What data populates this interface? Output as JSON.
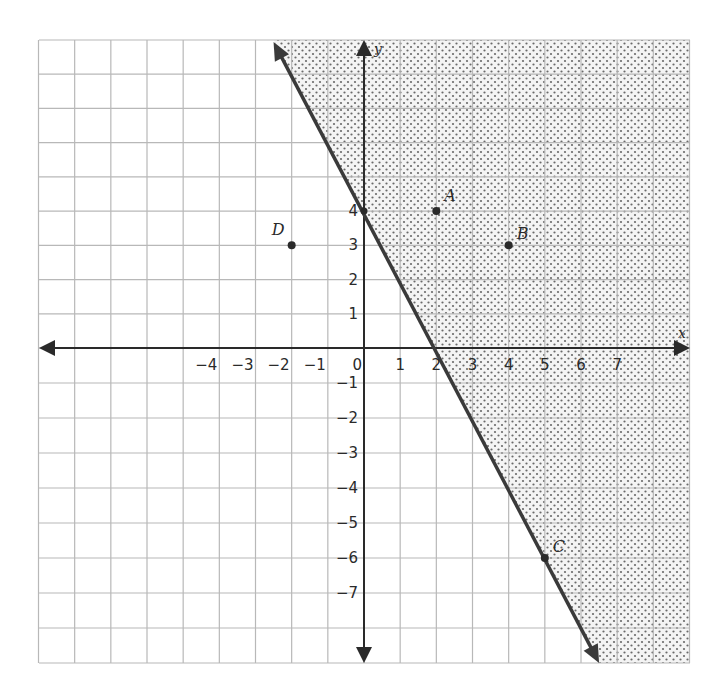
{
  "chart_data": {
    "type": "scatter",
    "title": "",
    "xlabel": "x",
    "ylabel": "y",
    "xlim": [
      -9,
      9
    ],
    "ylim": [
      -9,
      9
    ],
    "grid": true,
    "x_tick_labels": [
      "-4",
      "-3",
      "-2",
      "-1",
      "0",
      "1",
      "2",
      "3",
      "4",
      "5",
      "6",
      "7"
    ],
    "y_tick_labels": [
      "4",
      "3",
      "2",
      "1",
      "-1",
      "-2",
      "-3",
      "-4",
      "-5",
      "-6",
      "-7"
    ],
    "boundary_line": {
      "equation": "y = -2x + 4",
      "slope": -2,
      "intercept": 4,
      "style": "solid",
      "shaded_side": "right",
      "passes_through": [
        [
          0,
          4
        ],
        [
          2,
          0
        ],
        [
          5,
          -6
        ]
      ]
    },
    "points": [
      {
        "label": "A",
        "x": 2,
        "y": 4
      },
      {
        "label": "B",
        "x": 4,
        "y": 3
      },
      {
        "label": "C",
        "x": 5,
        "y": -6
      },
      {
        "label": "D",
        "x": -2,
        "y": 3
      }
    ],
    "colors": {
      "grid": "#b8b8b8",
      "axis": "#2a2a2a",
      "line": "#3a3a3a",
      "dots": "#6a6a6a",
      "shading": "#f2f2f2"
    }
  }
}
